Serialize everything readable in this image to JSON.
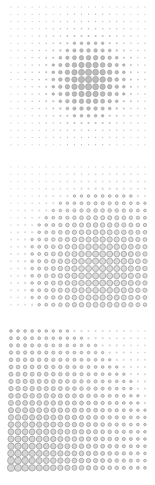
{
  "chart_data": [
    {
      "type": "scatter",
      "title": "",
      "description": "20x20 dot grid, size peaked in center (gaussian)",
      "grid": {
        "cols": 20,
        "rows": 20
      },
      "peak": {
        "col": 11,
        "row": 10
      },
      "spread": 3.2,
      "min_radius": 0.6,
      "max_radius": 3.2,
      "style": "filled",
      "fill": "#bdbdbd",
      "stroke": "#9a9a9a",
      "origin": {
        "x": 11,
        "y": 7
      },
      "spacing": {
        "x": 7.05,
        "y": 7.25
      }
    },
    {
      "type": "scatter",
      "title": "",
      "description": "20x20 dot grid, size peaked lower-right (broad gaussian)",
      "grid": {
        "cols": 20,
        "rows": 20
      },
      "peak": {
        "col": 13,
        "row": 14
      },
      "spread": 6.5,
      "min_radius": 0.6,
      "max_radius": 3.1,
      "style": "outline",
      "fill": "#dcdcdc",
      "stroke": "#a0a0a0",
      "origin": {
        "x": 11,
        "y": 167
      },
      "spacing": {
        "x": 7.05,
        "y": 7.25
      }
    },
    {
      "type": "scatter",
      "title": "",
      "description": "20x20 dot grid, size gradient decreasing from bottom-left to top-right",
      "grid": {
        "cols": 20,
        "rows": 20
      },
      "peak": {
        "col": 0,
        "row": 19
      },
      "spread": 0,
      "min_radius": 0.8,
      "max_radius": 3.6,
      "style": "outline",
      "fill": "#d6d6d6",
      "stroke": "#a0a0a0",
      "origin": {
        "x": 11,
        "y": 331
      },
      "spacing": {
        "x": 7.05,
        "y": 7.2
      }
    }
  ]
}
